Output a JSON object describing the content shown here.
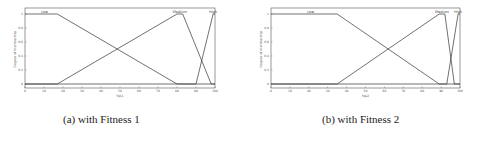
{
  "chart_data": [
    {
      "type": "line",
      "title": "",
      "caption": "(a) with Fitness 1",
      "xlabel": "fsp1",
      "ylabel": "Degree of membership",
      "xlim": [
        0,
        100
      ],
      "ylim": [
        0,
        1
      ],
      "xticks": [
        "0",
        "10",
        "20",
        "30",
        "40",
        "50",
        "60",
        "70",
        "80",
        "90",
        "100"
      ],
      "yticks": [
        "0",
        "0.2",
        "0.4",
        "0.6",
        "0.8",
        "1"
      ],
      "grid": false,
      "series": [
        {
          "name": "Low",
          "x": [
            0,
            17,
            80,
            100
          ],
          "y": [
            1,
            1,
            0,
            0
          ]
        },
        {
          "name": "Medium",
          "x": [
            0,
            17,
            80,
            83,
            98,
            100
          ],
          "y": [
            0,
            0,
            1,
            1,
            0,
            0
          ]
        },
        {
          "name": "High",
          "x": [
            0,
            90,
            99,
            100
          ],
          "y": [
            0,
            0,
            1,
            1
          ]
        }
      ]
    },
    {
      "type": "line",
      "title": "",
      "caption": "(b) with Fitness 2",
      "xlabel": "fsp2",
      "ylabel": "Degree of membership",
      "xlim": [
        0,
        100
      ],
      "ylim": [
        0,
        1
      ],
      "xticks": [
        "0",
        "10",
        "20",
        "30",
        "40",
        "50",
        "60",
        "70",
        "80",
        "90",
        "100"
      ],
      "yticks": [
        "0",
        "0.2",
        "0.4",
        "0.6",
        "0.8",
        "1"
      ],
      "grid": false,
      "series": [
        {
          "name": "Low",
          "x": [
            0,
            35,
            89,
            100
          ],
          "y": [
            1,
            1,
            0,
            0
          ]
        },
        {
          "name": "Medium",
          "x": [
            0,
            35,
            89,
            92,
            97,
            100
          ],
          "y": [
            0,
            0,
            1,
            1,
            0,
            0
          ]
        },
        {
          "name": "High",
          "x": [
            0,
            93,
            99,
            100
          ],
          "y": [
            0,
            0,
            1,
            1
          ]
        }
      ]
    }
  ],
  "captions": {
    "a": "(a) with Fitness 1",
    "b": "(b) with Fitness 2"
  }
}
